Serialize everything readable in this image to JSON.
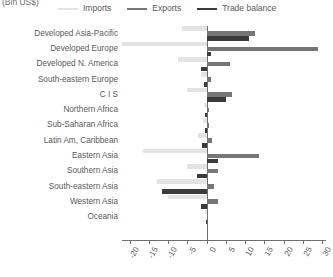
{
  "unit_label": "(Bln US$)",
  "legend": {
    "position": "top",
    "items": [
      {
        "label": "Imports",
        "color": "#e3e3e3",
        "name": "imports"
      },
      {
        "label": "Exports",
        "color": "#767676",
        "name": "exports"
      },
      {
        "label": "Trade balance",
        "color": "#3b3b3b",
        "name": "trade-balance"
      }
    ]
  },
  "axis": {
    "ticks": [
      -20,
      -15,
      -10,
      -5,
      0,
      5,
      10,
      15,
      20,
      25,
      30
    ],
    "tick_labels": [
      "-20",
      "-15",
      "-10",
      "-5",
      "0",
      "5",
      "10",
      "15",
      "20",
      "25",
      "30"
    ],
    "min": -22,
    "max": 31
  },
  "chart_data": {
    "type": "bar",
    "orientation": "horizontal",
    "title": "",
    "subtitle": "",
    "xlabel": "(Bln US$)",
    "ylabel": "",
    "xlim": [
      -22,
      31
    ],
    "grid": false,
    "legend_position": "top",
    "categories": [
      "Developed Asia-Pacific",
      "Developed Europe",
      "Developed N. America",
      "South-eastern Europe",
      "C I S",
      "Northern Africa",
      "Sub-Saharan Africa",
      "Latin Am, Caribbean",
      "Eastern Asia",
      "Southern Asia",
      "South-eastern Asia",
      "Western Asia",
      "Oceania"
    ],
    "series": [
      {
        "name": "Imports",
        "color": "#e3e3e3",
        "values": [
          -6.5,
          -22.0,
          -7.5,
          -1.5,
          -5.0,
          -0.8,
          -1.0,
          -2.2,
          -16.5,
          -5.0,
          -13.0,
          -10.0,
          -0.4
        ]
      },
      {
        "name": "Exports",
        "color": "#767676",
        "values": [
          12.5,
          29.0,
          6.0,
          1.2,
          6.5,
          0.6,
          0.7,
          1.4,
          13.5,
          3.0,
          2.0,
          3.0,
          0.3
        ]
      },
      {
        "name": "Trade balance",
        "color": "#3b3b3b",
        "values": [
          11.0,
          1.2,
          -1.5,
          -0.6,
          5.0,
          -0.5,
          -0.5,
          -1.2,
          3.0,
          -2.5,
          -11.5,
          -1.5,
          -0.2
        ]
      }
    ]
  }
}
